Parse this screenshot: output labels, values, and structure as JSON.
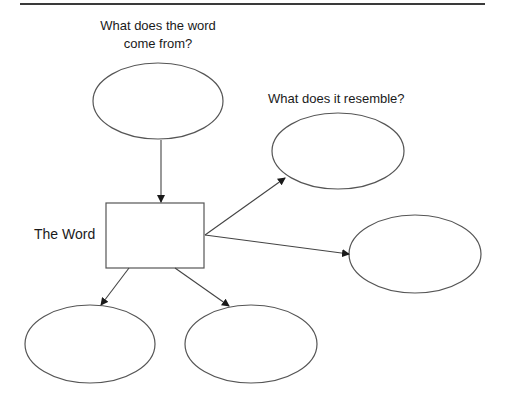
{
  "diagram": {
    "title_rule": true,
    "labels": {
      "origin_line1": "What does the word",
      "origin_line2": "come from?",
      "resemble": "What does it resemble?",
      "center": "The Word"
    },
    "nodes": [
      {
        "id": "origin",
        "shape": "ellipse",
        "cx": 158,
        "cy": 101,
        "rx": 65,
        "ry": 38,
        "text": ""
      },
      {
        "id": "resemble-1",
        "shape": "ellipse",
        "cx": 338,
        "cy": 151,
        "rx": 66,
        "ry": 38,
        "text": ""
      },
      {
        "id": "resemble-2",
        "shape": "ellipse",
        "cx": 415,
        "cy": 254,
        "rx": 66,
        "ry": 39,
        "text": ""
      },
      {
        "id": "bottom-left",
        "shape": "ellipse",
        "cx": 90,
        "cy": 344,
        "rx": 65,
        "ry": 39,
        "text": ""
      },
      {
        "id": "bottom-right",
        "shape": "ellipse",
        "cx": 251,
        "cy": 344,
        "rx": 66,
        "ry": 39,
        "text": ""
      },
      {
        "id": "word-box",
        "shape": "rect",
        "x": 106,
        "y": 203,
        "w": 98,
        "h": 65,
        "text": ""
      }
    ],
    "edges": [
      {
        "from": "origin",
        "to": "word-box"
      },
      {
        "from": "word-box",
        "to": "resemble-1"
      },
      {
        "from": "word-box",
        "to": "resemble-2"
      },
      {
        "from": "word-box",
        "to": "bottom-left"
      },
      {
        "from": "word-box",
        "to": "bottom-right"
      }
    ],
    "stroke_color": "#555555",
    "arrow_color": "#1a1a1a"
  }
}
